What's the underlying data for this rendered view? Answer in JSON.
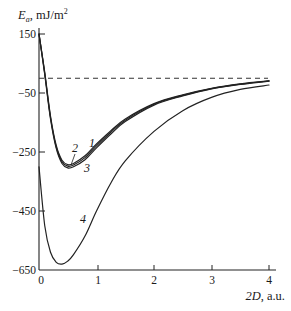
{
  "chart_data": {
    "type": "line",
    "title": "",
    "xlabel": "2D, a.u.",
    "ylabel": "E_a, mJ/m²",
    "xlim": [
      0,
      4
    ],
    "ylim": [
      -650,
      150
    ],
    "x_ticks": [
      0,
      1,
      2,
      3,
      4
    ],
    "y_ticks": [
      150,
      -50,
      -250,
      -450,
      -650
    ],
    "grid": false,
    "legend": "inline curve labels 1-4",
    "reference_line": {
      "y": 0,
      "style": "dashed"
    },
    "x": [
      0,
      0.1,
      0.2,
      0.3,
      0.4,
      0.5,
      0.6,
      0.8,
      1.0,
      1.25,
      1.5,
      2.0,
      2.5,
      3.0,
      3.5,
      4.0
    ],
    "series": [
      {
        "name": "1",
        "values": [
          150,
          20,
          -128,
          -228,
          -278,
          -293,
          -289,
          -263,
          -223,
          -178,
          -138,
          -86,
          -56,
          -34,
          -19,
          -9
        ]
      },
      {
        "name": "2",
        "values": [
          150,
          16,
          -133,
          -233,
          -283,
          -298,
          -294,
          -269,
          -229,
          -183,
          -142,
          -88,
          -58,
          -35,
          -20,
          -9
        ]
      },
      {
        "name": "3",
        "values": [
          150,
          12,
          -138,
          -238,
          -289,
          -304,
          -300,
          -276,
          -236,
          -189,
          -147,
          -91,
          -60,
          -36,
          -21,
          -10
        ]
      },
      {
        "name": "4",
        "values": [
          -300,
          -500,
          -590,
          -624,
          -630,
          -620,
          -598,
          -535,
          -450,
          -355,
          -280,
          -180,
          -110,
          -65,
          -38,
          -23
        ]
      }
    ]
  },
  "axes": {
    "y_title_main": "E",
    "y_title_sub": "a",
    "y_title_rest": ", mJ/m",
    "y_title_sup": "2",
    "x_title_italic": "2D",
    "x_title_rest": ", a.u.",
    "x_tick_labels": [
      "0",
      "1",
      "2",
      "3",
      "4"
    ],
    "y_tick_labels": [
      "150",
      "−50",
      "−250",
      "−450",
      "−650"
    ]
  },
  "curve_labels": [
    "1",
    "2",
    "3",
    "4"
  ]
}
